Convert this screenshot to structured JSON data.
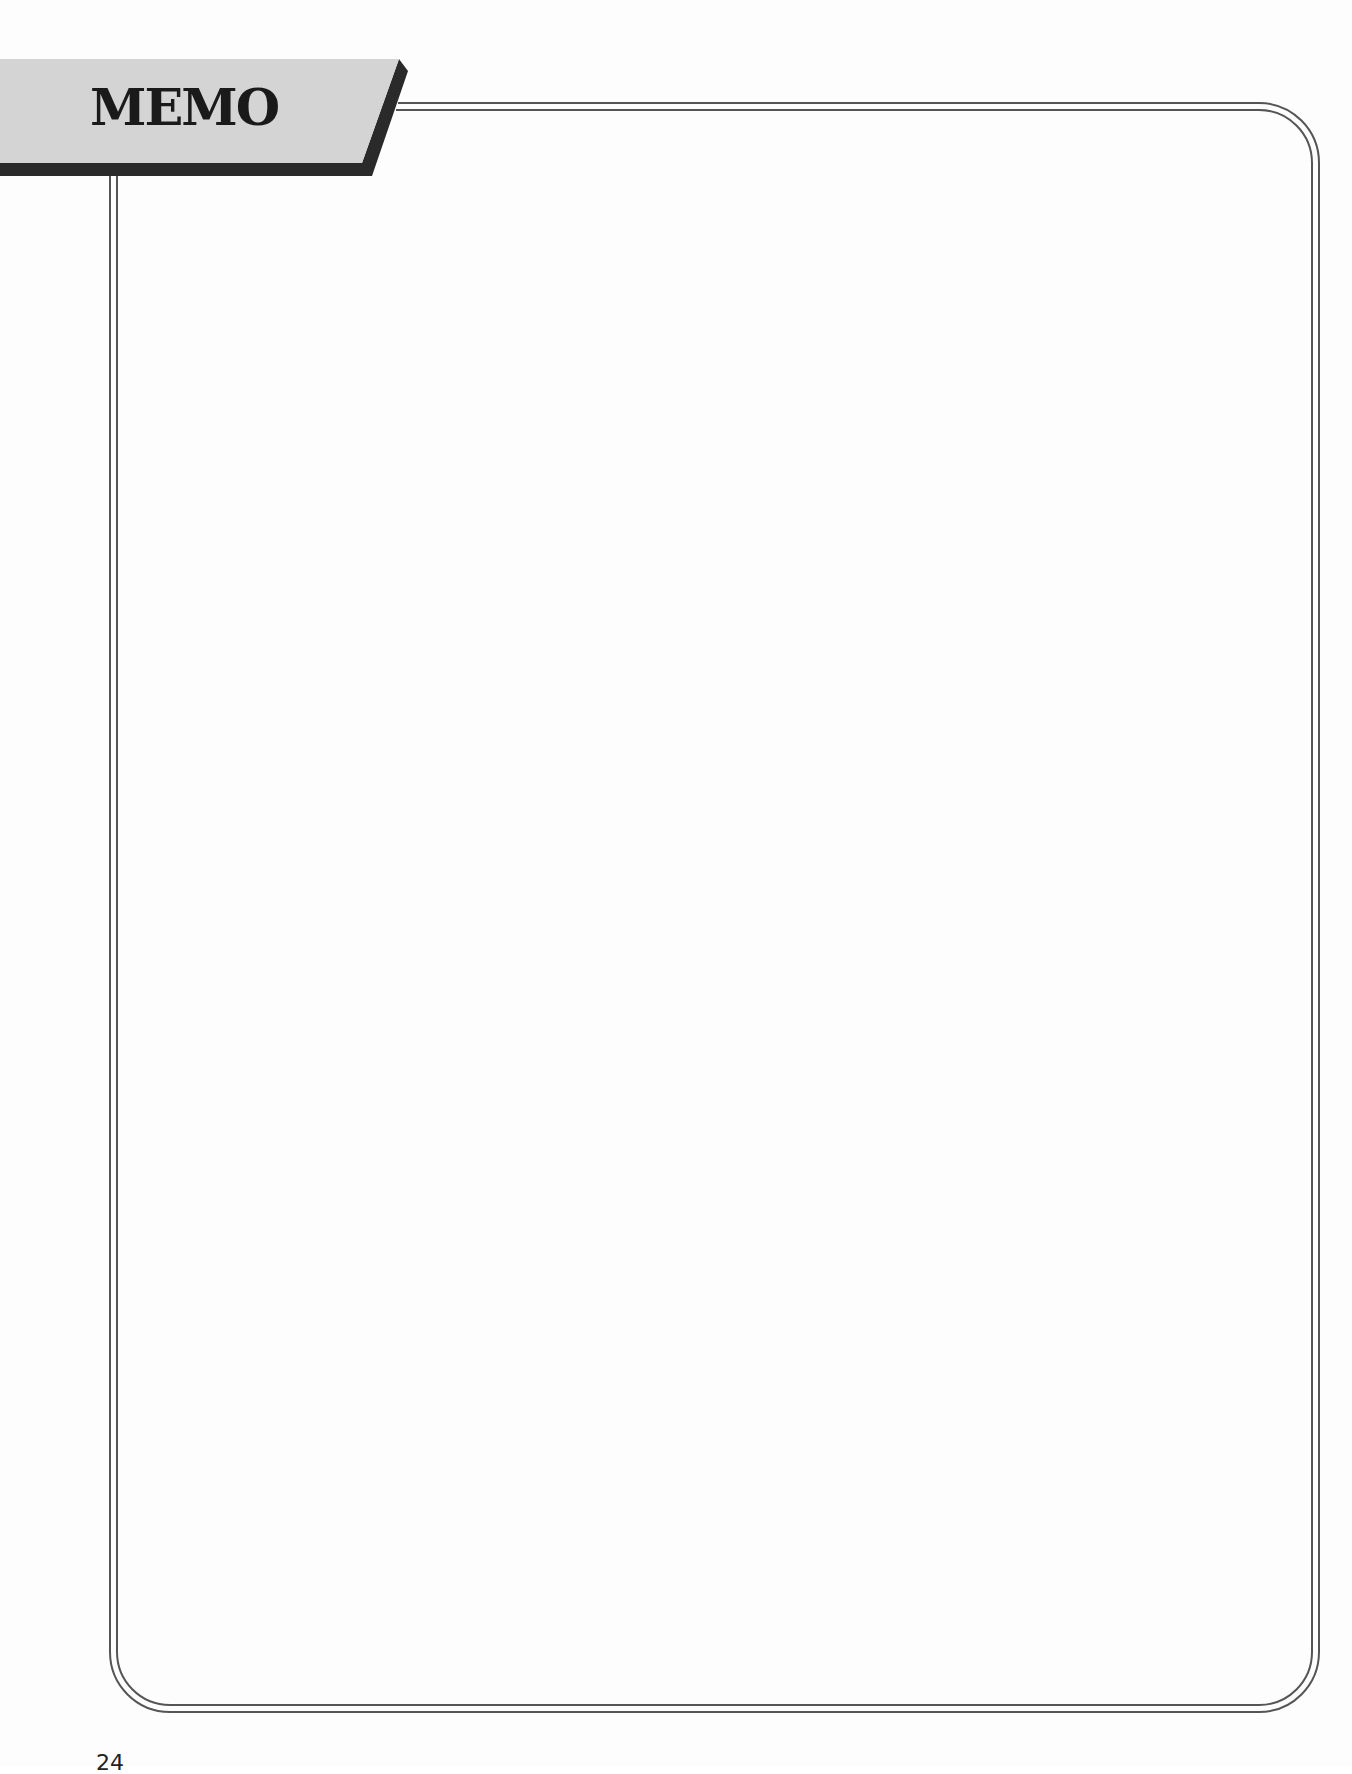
{
  "banner": {
    "title": "MEMO"
  },
  "memo_area": {
    "content": ""
  },
  "footer": {
    "page_number": "24"
  },
  "colors": {
    "banner_fill": "#d4d4d4",
    "banner_shadow": "#2a2a2a",
    "frame_line": "#555555",
    "title_text": "#1a1a1a",
    "background": "#fdfdfd"
  }
}
